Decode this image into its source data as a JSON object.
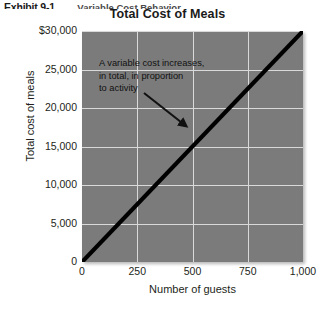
{
  "exhibit": {
    "label": "Exhibit 9-1",
    "caption": "Variable Cost Behavior"
  },
  "chart_data": {
    "type": "line",
    "title": "Total Cost of Meals",
    "xlabel": "Number of guests",
    "ylabel": "Total cost of meals",
    "xlim": [
      0,
      1000
    ],
    "ylim": [
      0,
      30000
    ],
    "xticks": [
      "0",
      "250",
      "500",
      "750",
      "1,000"
    ],
    "xtick_values": [
      0,
      250,
      500,
      750,
      1000
    ],
    "yticks": [
      "0",
      "5,000",
      "10,000",
      "15,000",
      "20,000",
      "25,000",
      "$30,000"
    ],
    "ytick_values": [
      0,
      5000,
      10000,
      15000,
      20000,
      25000,
      30000
    ],
    "grid": true,
    "legend": "none",
    "series": [
      {
        "name": "Total cost of meals",
        "x": [
          0,
          1000
        ],
        "values": [
          0,
          30000
        ]
      }
    ],
    "annotations": [
      {
        "name": "variable-cost-note",
        "lines": [
          "A variable cost increases,",
          "in total, in proportion",
          "to activity"
        ],
        "arrow_from": [
          155,
          100
        ],
        "arrow_to": [
          193,
          131
        ]
      }
    ],
    "colors": {
      "plot_background": "#7b7b7b",
      "gridline": "#d9d9d9",
      "series_line": "#000000",
      "text": "#231f20"
    }
  }
}
